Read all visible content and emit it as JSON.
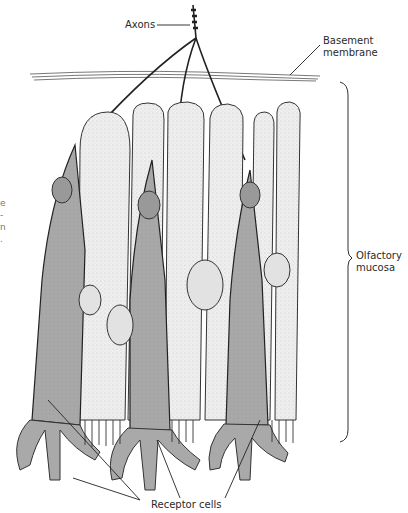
{
  "figure": {
    "labels": {
      "axons": "Axons",
      "basement_membrane_line1": "Basement",
      "basement_membrane_line2": "membrane",
      "olfactory_line1": "Olfactory",
      "olfactory_line2": "mucosa",
      "receptor_cells": "Receptor cells"
    },
    "clipped_left_text": [
      "e",
      "-",
      "n",
      "."
    ],
    "colors": {
      "receptor_cell_fill": "#a9a9a9",
      "supporting_cell_fill": "#ececec",
      "outline": "#222222",
      "background": "#ffffff"
    }
  }
}
